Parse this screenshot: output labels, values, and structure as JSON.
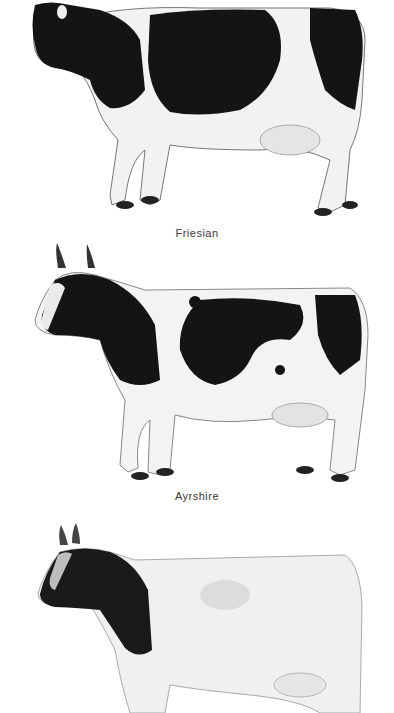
{
  "illustration": {
    "background": "#ffffff",
    "breeds": [
      {
        "label": "Friesian",
        "pattern": "black-and-white patches, large black body areas"
      },
      {
        "label": "Ayrshire",
        "pattern": "white with black irregular patches, upright horns"
      },
      {
        "label": "",
        "pattern": "black head and neck, white/grey belted body, short horns"
      }
    ]
  },
  "colors": {
    "black": "#111111",
    "white": "#f4f4f4",
    "shade": "#9a9a9a",
    "caption": "#3a3a3a"
  }
}
